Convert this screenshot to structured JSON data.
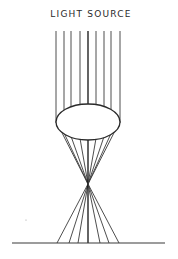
{
  "title": "LIGHT SOURCE",
  "diagram": {
    "type": "convex lens focusing parallel light rays",
    "colors": {
      "line": "#3a3a3a",
      "center_ray": "#111111",
      "background": "#ffffff"
    },
    "incoming_rays_x": [
      56,
      64,
      71,
      80,
      88,
      96,
      104,
      111,
      120
    ],
    "ray_top_y": 31,
    "lens": {
      "cx": 88,
      "cy": 122,
      "rx": 32,
      "ry": 18
    },
    "focal_point": {
      "x": 88,
      "y": 184
    },
    "ground": {
      "x1": 12,
      "x2": 165,
      "y": 243
    },
    "ground_hits_x": [
      57,
      69,
      78,
      88,
      100,
      109,
      119
    ]
  }
}
